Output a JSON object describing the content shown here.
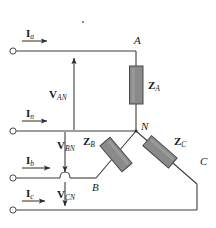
{
  "diagram": {
    "type": "electrical-circuit-schematic",
    "colors": {
      "wire": "#3c3c3c",
      "impedance_fill": "#8a8a8a",
      "impedance_stroke": "#4a4a4a",
      "text": "#1a1a1a",
      "background": "#ffffff"
    },
    "currents": [
      {
        "symbol": "I",
        "subscript": "a",
        "label": "Ia",
        "direction": "right"
      },
      {
        "symbol": "I",
        "subscript": "n",
        "label": "In",
        "direction": "right"
      },
      {
        "symbol": "I",
        "subscript": "b",
        "label": "Ib",
        "direction": "right"
      },
      {
        "symbol": "I",
        "subscript": "c",
        "label": "Ic",
        "direction": "right"
      }
    ],
    "voltages": [
      {
        "symbol": "V",
        "subscript": "AN",
        "label": "VAN",
        "direction": "up"
      },
      {
        "symbol": "V",
        "subscript": "BN",
        "label": "VBN",
        "direction": "down"
      },
      {
        "symbol": "V",
        "subscript": "CN",
        "label": "VCN",
        "direction": "down"
      }
    ],
    "impedances": [
      {
        "symbol": "Z",
        "subscript": "A",
        "label": "ZA",
        "orientation": "vertical"
      },
      {
        "symbol": "Z",
        "subscript": "B",
        "label": "ZB",
        "orientation": "diagonal-down-left"
      },
      {
        "symbol": "Z",
        "subscript": "C",
        "label": "ZC",
        "orientation": "diagonal-down-right"
      }
    ],
    "nodes": [
      {
        "label": "A"
      },
      {
        "label": "N"
      },
      {
        "label": "B"
      },
      {
        "label": "C"
      }
    ],
    "terminals": [
      {
        "name": "terminal-a"
      },
      {
        "name": "terminal-n"
      },
      {
        "name": "terminal-b"
      },
      {
        "name": "terminal-c"
      }
    ]
  }
}
